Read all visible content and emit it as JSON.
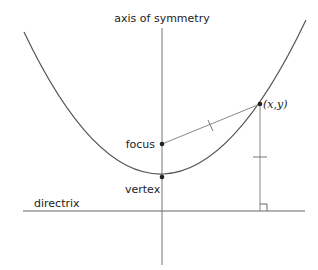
{
  "diagram": {
    "labels": {
      "axis": "axis of symmetry",
      "focus": "focus",
      "vertex": "vertex",
      "directrix": "directrix",
      "point": "(x,y)"
    },
    "colors": {
      "curve": "#555555",
      "lines": "#888888",
      "points": "#222222",
      "text": "#222222"
    },
    "geometry": {
      "vertex": [
        162,
        177
      ],
      "focus": [
        162,
        144
      ],
      "point": [
        260,
        104
      ],
      "directrix_y": 211,
      "axis_x": 162
    },
    "annotations": {
      "equal_distance_ticks": 2,
      "right_angle_marker": true
    }
  }
}
